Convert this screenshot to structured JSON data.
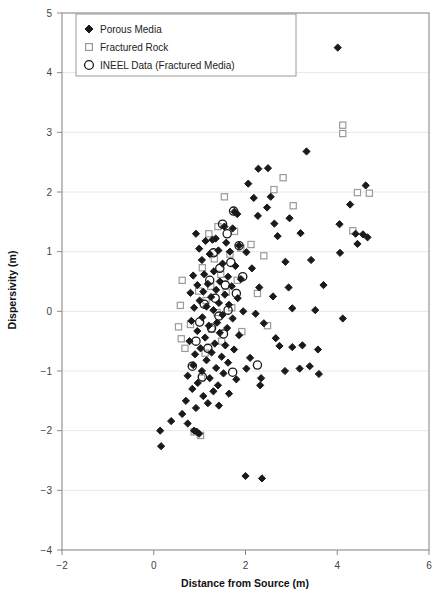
{
  "chart_data": {
    "type": "scatter",
    "title": "",
    "xlabel": "Distance from Source (m)",
    "ylabel": "Dispersivity (m)",
    "xlim": [
      -2,
      6
    ],
    "ylim": [
      -4,
      5
    ],
    "xticks": [
      -2,
      0,
      2,
      4,
      6
    ],
    "yticks": [
      -4,
      -3,
      -2,
      -1,
      0,
      1,
      2,
      3,
      4,
      5
    ],
    "xtick_labels": [
      "−2",
      "0",
      "2",
      "4",
      "6"
    ],
    "ytick_labels": [
      "−4",
      "−3",
      "−2",
      "−1",
      "0",
      "1",
      "2",
      "3",
      "4",
      "5"
    ],
    "grid": "horizontal-major-faint",
    "legend_position": "top-left-inside",
    "series": [
      {
        "name": "Porous Media",
        "marker": "diamond",
        "color": "#1a1a1a",
        "filled": true,
        "points": [
          [
            4.01,
            4.42
          ],
          [
            3.33,
            2.68
          ],
          [
            2.49,
            2.4
          ],
          [
            2.28,
            2.39
          ],
          [
            2.06,
            2.14
          ],
          [
            2.18,
            1.9
          ],
          [
            2.55,
            1.92
          ],
          [
            4.62,
            2.11
          ],
          [
            4.28,
            1.79
          ],
          [
            2.47,
            1.74
          ],
          [
            1.76,
            1.67
          ],
          [
            1.82,
            1.63
          ],
          [
            2.27,
            1.6
          ],
          [
            2.96,
            1.56
          ],
          [
            2.63,
            1.47
          ],
          [
            4.05,
            1.46
          ],
          [
            1.54,
            1.42
          ],
          [
            1.72,
            1.39
          ],
          [
            3.2,
            1.31
          ],
          [
            4.4,
            1.3
          ],
          [
            4.56,
            1.29
          ],
          [
            4.66,
            1.24
          ],
          [
            4.44,
            1.13
          ],
          [
            1.28,
            1.2
          ],
          [
            1.35,
            1.22
          ],
          [
            1.13,
            1.18
          ],
          [
            1.58,
            1.15
          ],
          [
            1.86,
            1.1
          ],
          [
            0.99,
            1.05
          ],
          [
            1.41,
            1.02
          ],
          [
            1.66,
            1.0
          ],
          [
            2.02,
            0.99
          ],
          [
            4.06,
            0.98
          ],
          [
            3.43,
            0.86
          ],
          [
            2.87,
            0.83
          ],
          [
            1.22,
            0.96
          ],
          [
            0.92,
            1.3
          ],
          [
            1.05,
            0.86
          ],
          [
            1.5,
            0.8
          ],
          [
            1.78,
            0.76
          ],
          [
            2.14,
            0.72
          ],
          [
            1.31,
            0.67
          ],
          [
            1.1,
            0.62
          ],
          [
            0.86,
            0.6
          ],
          [
            1.62,
            0.58
          ],
          [
            1.9,
            0.54
          ],
          [
            1.44,
            0.5
          ],
          [
            1.18,
            0.46
          ],
          [
            0.95,
            0.44
          ],
          [
            1.7,
            0.42
          ],
          [
            2.3,
            0.4
          ],
          [
            1.36,
            0.36
          ],
          [
            1.08,
            0.33
          ],
          [
            0.8,
            0.31
          ],
          [
            1.55,
            0.28
          ],
          [
            1.25,
            0.24
          ],
          [
            1.83,
            0.22
          ],
          [
            2.6,
            0.25
          ],
          [
            3.02,
            0.05
          ],
          [
            1.0,
            0.18
          ],
          [
            1.42,
            0.14
          ],
          [
            1.64,
            0.11
          ],
          [
            1.15,
            0.08
          ],
          [
            0.88,
            0.06
          ],
          [
            1.3,
            0.02
          ],
          [
            1.95,
            0.0
          ],
          [
            2.22,
            -0.04
          ],
          [
            1.5,
            -0.06
          ],
          [
            1.06,
            -0.1
          ],
          [
            1.72,
            -0.12
          ],
          [
            0.82,
            -0.16
          ],
          [
            1.38,
            -0.19
          ],
          [
            2.4,
            -0.2
          ],
          [
            1.2,
            -0.24
          ],
          [
            1.6,
            -0.28
          ],
          [
            0.95,
            -0.33
          ],
          [
            1.44,
            -0.36
          ],
          [
            1.86,
            -0.4
          ],
          [
            1.12,
            -0.44
          ],
          [
            2.66,
            -0.45
          ],
          [
            0.78,
            -0.5
          ],
          [
            1.33,
            -0.54
          ],
          [
            1.56,
            -0.57
          ],
          [
            1.02,
            -0.62
          ],
          [
            1.75,
            -0.64
          ],
          [
            1.26,
            -0.69
          ],
          [
            0.9,
            -0.72
          ],
          [
            1.48,
            -0.76
          ],
          [
            2.1,
            -0.78
          ],
          [
            1.15,
            -0.82
          ],
          [
            1.62,
            -0.86
          ],
          [
            0.86,
            -0.9
          ],
          [
            1.36,
            -0.95
          ],
          [
            2.02,
            -0.96
          ],
          [
            1.05,
            -1.0
          ],
          [
            1.52,
            -1.04
          ],
          [
            0.74,
            -1.08
          ],
          [
            1.22,
            -1.12
          ],
          [
            1.8,
            -1.14
          ],
          [
            0.96,
            -1.2
          ],
          [
            1.4,
            -1.24
          ],
          [
            2.34,
            -1.12
          ],
          [
            2.32,
            -1.24
          ],
          [
            0.84,
            -1.3
          ],
          [
            1.3,
            -1.34
          ],
          [
            1.64,
            -1.38
          ],
          [
            1.08,
            -1.42
          ],
          [
            0.7,
            -1.5
          ],
          [
            1.18,
            -1.54
          ],
          [
            0.92,
            -1.62
          ],
          [
            1.42,
            -1.58
          ],
          [
            0.62,
            -1.72
          ],
          [
            0.38,
            -1.84
          ],
          [
            0.74,
            -1.88
          ],
          [
            0.88,
            -2.0
          ],
          [
            0.94,
            -2.02
          ],
          [
            0.99,
            -2.05
          ],
          [
            0.14,
            -2.0
          ],
          [
            0.16,
            -2.26
          ],
          [
            2.0,
            -2.76
          ],
          [
            2.36,
            -2.8
          ],
          [
            3.6,
            -1.05
          ],
          [
            3.58,
            -0.64
          ],
          [
            3.02,
            -0.6
          ],
          [
            2.74,
            -0.58
          ],
          [
            3.24,
            -0.57
          ],
          [
            3.4,
            -0.92
          ],
          [
            3.18,
            -0.96
          ],
          [
            2.86,
            -1.0
          ],
          [
            4.12,
            -0.12
          ],
          [
            3.52,
            0.02
          ],
          [
            2.7,
            1.26
          ],
          [
            2.94,
            0.4
          ],
          [
            3.7,
            0.44
          ]
        ]
      },
      {
        "name": "Fractured Rock",
        "marker": "square",
        "color": "#9a9a9a",
        "filled": false,
        "points": [
          [
            4.12,
            3.12
          ],
          [
            4.12,
            2.98
          ],
          [
            2.82,
            2.24
          ],
          [
            2.62,
            2.04
          ],
          [
            4.44,
            1.99
          ],
          [
            4.7,
            1.98
          ],
          [
            1.54,
            1.92
          ],
          [
            3.04,
            1.77
          ],
          [
            4.34,
            1.35
          ],
          [
            1.4,
            1.42
          ],
          [
            1.76,
            1.34
          ],
          [
            1.2,
            1.3
          ],
          [
            2.12,
            1.12
          ],
          [
            1.9,
            1.06
          ],
          [
            1.66,
            0.96
          ],
          [
            2.4,
            0.93
          ],
          [
            1.32,
            0.88
          ],
          [
            1.06,
            0.73
          ],
          [
            0.62,
            0.52
          ],
          [
            1.46,
            0.62
          ],
          [
            1.82,
            0.52
          ],
          [
            1.24,
            0.42
          ],
          [
            0.98,
            0.34
          ],
          [
            1.58,
            0.32
          ],
          [
            2.26,
            0.3
          ],
          [
            1.14,
            0.18
          ],
          [
            0.58,
            0.1
          ],
          [
            1.7,
            0.06
          ],
          [
            1.38,
            -0.02
          ],
          [
            2.48,
            -0.24
          ],
          [
            0.54,
            -0.26
          ],
          [
            0.8,
            -0.22
          ],
          [
            1.26,
            -0.3
          ],
          [
            1.92,
            -0.34
          ],
          [
            0.6,
            -0.46
          ],
          [
            1.48,
            -0.5
          ],
          [
            0.68,
            -0.62
          ],
          [
            1.12,
            -0.7
          ],
          [
            1.04,
            -1.12
          ],
          [
            0.88,
            -2.02
          ],
          [
            1.02,
            -2.08
          ]
        ]
      },
      {
        "name": "INEEL Data (Fractured Media)",
        "marker": "circle",
        "color": "#1a1a1a",
        "filled": false,
        "points": [
          [
            1.74,
            1.68
          ],
          [
            1.5,
            1.46
          ],
          [
            1.6,
            1.3
          ],
          [
            1.86,
            1.1
          ],
          [
            1.3,
            0.98
          ],
          [
            1.68,
            0.82
          ],
          [
            1.44,
            0.72
          ],
          [
            1.94,
            0.58
          ],
          [
            1.22,
            0.52
          ],
          [
            1.56,
            0.44
          ],
          [
            1.8,
            0.3
          ],
          [
            1.34,
            0.22
          ],
          [
            1.1,
            0.12
          ],
          [
            1.62,
            0.02
          ],
          [
            1.42,
            -0.08
          ],
          [
            1.0,
            -0.18
          ],
          [
            1.26,
            -0.28
          ],
          [
            1.52,
            -0.38
          ],
          [
            0.92,
            -0.5
          ],
          [
            1.18,
            -0.62
          ],
          [
            2.26,
            -0.9
          ],
          [
            0.84,
            -0.92
          ],
          [
            1.72,
            -1.02
          ],
          [
            1.06,
            -1.1
          ]
        ]
      }
    ]
  },
  "legend": {
    "items": [
      {
        "label": "Porous Media",
        "marker": "diamond"
      },
      {
        "label": "Fractured Rock",
        "marker": "square"
      },
      {
        "label": "INEEL Data (Fractured Media)",
        "marker": "circle"
      }
    ]
  },
  "axes": {
    "x_title": "Distance from Source (m)",
    "y_title": "Dispersivity (m)"
  }
}
